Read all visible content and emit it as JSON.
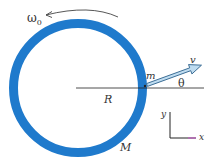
{
  "diagram": {
    "labels": {
      "omega": "ω",
      "omega_sub": "0",
      "mass_particle": "m",
      "velocity": "v",
      "angle": "θ",
      "radius": "R",
      "mass_ring": "M",
      "axis_y": "y",
      "axis_x": "x"
    },
    "colors": {
      "ring": "#1f7acc",
      "arrow_fill": "#bfdcf0",
      "arrow_stroke": "#2a5f8a",
      "line": "#222222",
      "axis_x": "#cc55cc",
      "text": "#333333"
    },
    "geometry": {
      "ring_center": [
        78,
        88
      ],
      "ring_outer_radius": 69,
      "ring_thickness": 9,
      "velocity_angle_deg": 20
    }
  }
}
